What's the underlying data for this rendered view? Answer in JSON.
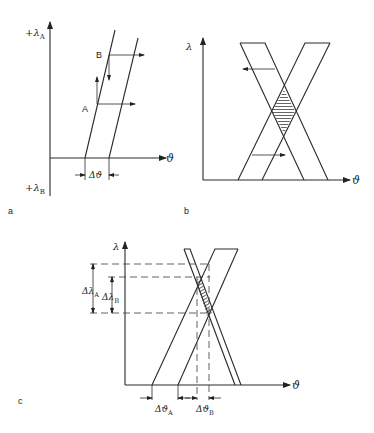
{
  "panels": {
    "a": {
      "label": "a",
      "y_top_label": "+λ",
      "y_top_sub": "A",
      "y_bottom_label": "+λ",
      "y_bottom_sub": "B",
      "x_axis_label": "ϑ",
      "point_a": "A",
      "point_b": "B",
      "delta_label": "Δϑ"
    },
    "b": {
      "label": "b",
      "y_axis_label": "λ",
      "x_axis_label": "ϑ"
    },
    "c": {
      "label": "c",
      "y_axis_label": "λ",
      "x_axis_label": "ϑ",
      "delta_lambda_a": "Δλ",
      "delta_lambda_a_sub": "A",
      "delta_lambda_b": "Δλ",
      "delta_lambda_b_sub": "B",
      "delta_theta_a": "Δϑ",
      "delta_theta_a_sub": "A",
      "delta_theta_b": "Δϑ",
      "delta_theta_b_sub": "B"
    }
  }
}
